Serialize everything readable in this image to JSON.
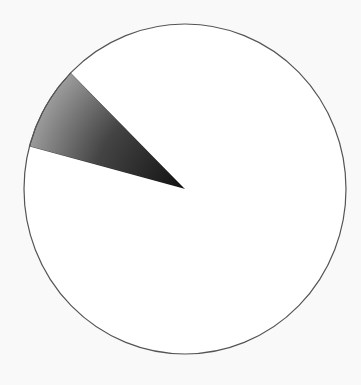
{
  "chart_data": {
    "type": "pie",
    "title": "",
    "categories": [
      "Shaded slice",
      "Remainder"
    ],
    "values": [
      8.3,
      91.7
    ],
    "colors": [
      "#3a3a3a",
      "#ffffff"
    ],
    "start_angle_deg": 194.9,
    "legend": null,
    "outline_color": "#555555"
  },
  "geometry": {
    "cx": 185,
    "cy": 189,
    "rx": 161,
    "ry": 165
  }
}
